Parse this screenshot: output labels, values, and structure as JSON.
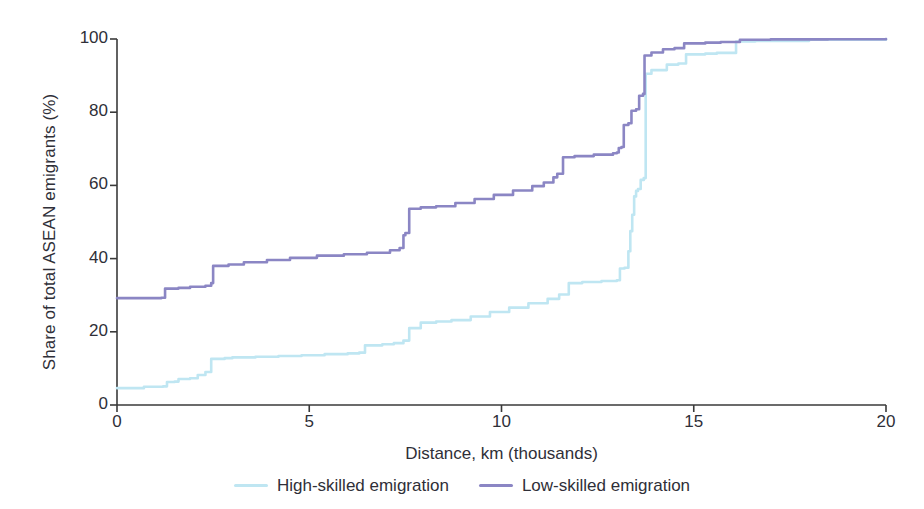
{
  "chart_data": {
    "type": "line",
    "title": "",
    "subtitle": "",
    "xlabel": "Distance, km (thousands)",
    "ylabel": "Share of total ASEAN emigrants (%)",
    "xlim": [
      0,
      20
    ],
    "ylim": [
      0,
      100
    ],
    "xticks": [
      0,
      5,
      10,
      15,
      20
    ],
    "yticks": [
      0,
      20,
      40,
      60,
      80,
      100
    ],
    "xtick_labels": [
      "0",
      "5",
      "10",
      "15",
      "20"
    ],
    "ytick_labels": [
      "0",
      "20",
      "40",
      "60",
      "80",
      "100"
    ],
    "grid": false,
    "legend_position": "bottom-center",
    "colors": {
      "high_skilled": "#bfe6f2",
      "low_skilled": "#8b86c4",
      "axis": "#3a3a3a",
      "text": "#2f2f38",
      "background": "#ffffff"
    },
    "series": [
      {
        "name": "High-skilled emigration",
        "color": "#bfe6f2",
        "step": true,
        "points": [
          [
            0.0,
            4.6
          ],
          [
            0.6,
            4.6
          ],
          [
            0.7,
            5.0
          ],
          [
            1.2,
            5.1
          ],
          [
            1.3,
            6.3
          ],
          [
            1.5,
            6.4
          ],
          [
            1.6,
            7.1
          ],
          [
            1.9,
            7.3
          ],
          [
            2.1,
            8.2
          ],
          [
            2.3,
            9.0
          ],
          [
            2.45,
            12.6
          ],
          [
            2.8,
            12.8
          ],
          [
            3.0,
            13.0
          ],
          [
            3.6,
            13.2
          ],
          [
            4.2,
            13.4
          ],
          [
            4.8,
            13.6
          ],
          [
            5.4,
            13.9
          ],
          [
            6.0,
            14.1
          ],
          [
            6.3,
            14.3
          ],
          [
            6.45,
            16.3
          ],
          [
            6.9,
            16.6
          ],
          [
            7.2,
            16.9
          ],
          [
            7.45,
            17.6
          ],
          [
            7.6,
            21.0
          ],
          [
            7.9,
            22.5
          ],
          [
            8.3,
            22.8
          ],
          [
            8.7,
            23.2
          ],
          [
            9.2,
            24.2
          ],
          [
            9.7,
            25.4
          ],
          [
            10.2,
            26.6
          ],
          [
            10.7,
            27.8
          ],
          [
            11.2,
            29.0
          ],
          [
            11.5,
            30.2
          ],
          [
            11.75,
            33.3
          ],
          [
            12.1,
            33.6
          ],
          [
            12.6,
            33.9
          ],
          [
            13.0,
            34.1
          ],
          [
            13.08,
            37.3
          ],
          [
            13.2,
            37.5
          ],
          [
            13.3,
            42.0
          ],
          [
            13.35,
            47.5
          ],
          [
            13.4,
            52.0
          ],
          [
            13.45,
            57.0
          ],
          [
            13.5,
            58.5
          ],
          [
            13.55,
            59.0
          ],
          [
            13.62,
            61.5
          ],
          [
            13.7,
            62.0
          ],
          [
            13.75,
            90.5
          ],
          [
            13.9,
            91.5
          ],
          [
            14.3,
            93.0
          ],
          [
            14.6,
            93.3
          ],
          [
            14.8,
            95.8
          ],
          [
            15.3,
            96.0
          ],
          [
            15.6,
            96.2
          ],
          [
            16.1,
            99.3
          ],
          [
            16.6,
            99.5
          ],
          [
            18.0,
            99.8
          ],
          [
            20.0,
            100.0
          ]
        ]
      },
      {
        "name": "Low-skilled emigration",
        "color": "#8b86c4",
        "step": true,
        "points": [
          [
            0.0,
            29.2
          ],
          [
            0.6,
            29.2
          ],
          [
            1.15,
            29.3
          ],
          [
            1.25,
            31.8
          ],
          [
            1.6,
            32.0
          ],
          [
            1.9,
            32.3
          ],
          [
            2.3,
            32.6
          ],
          [
            2.45,
            33.3
          ],
          [
            2.5,
            38.0
          ],
          [
            2.9,
            38.4
          ],
          [
            3.3,
            39.0
          ],
          [
            3.9,
            39.6
          ],
          [
            4.5,
            40.2
          ],
          [
            5.2,
            40.8
          ],
          [
            5.9,
            41.2
          ],
          [
            6.5,
            41.6
          ],
          [
            7.1,
            42.3
          ],
          [
            7.35,
            42.9
          ],
          [
            7.45,
            46.4
          ],
          [
            7.5,
            47.0
          ],
          [
            7.6,
            53.6
          ],
          [
            7.9,
            54.0
          ],
          [
            8.3,
            54.3
          ],
          [
            8.8,
            55.2
          ],
          [
            9.3,
            56.3
          ],
          [
            9.8,
            57.4
          ],
          [
            10.3,
            58.6
          ],
          [
            10.8,
            59.8
          ],
          [
            11.1,
            60.8
          ],
          [
            11.35,
            62.2
          ],
          [
            11.45,
            63.2
          ],
          [
            11.6,
            67.7
          ],
          [
            11.9,
            68.0
          ],
          [
            12.4,
            68.4
          ],
          [
            12.9,
            68.8
          ],
          [
            13.0,
            69.0
          ],
          [
            13.05,
            70.2
          ],
          [
            13.12,
            70.5
          ],
          [
            13.18,
            76.5
          ],
          [
            13.3,
            77.0
          ],
          [
            13.38,
            80.4
          ],
          [
            13.5,
            80.8
          ],
          [
            13.58,
            84.5
          ],
          [
            13.68,
            85.0
          ],
          [
            13.72,
            95.5
          ],
          [
            13.9,
            96.3
          ],
          [
            14.2,
            97.2
          ],
          [
            14.5,
            97.5
          ],
          [
            14.75,
            98.8
          ],
          [
            15.3,
            99.0
          ],
          [
            15.7,
            99.2
          ],
          [
            16.2,
            99.8
          ],
          [
            17.0,
            99.9
          ],
          [
            18.5,
            99.95
          ],
          [
            20.0,
            100.0
          ]
        ]
      }
    ]
  },
  "axis": {
    "y_title": "Share of total ASEAN emigrants (%)",
    "x_title": "Distance, km (thousands)"
  },
  "legend": {
    "items": [
      {
        "label": "High-skilled emigration",
        "color": "#bfe6f2"
      },
      {
        "label": "Low-skilled emigration",
        "color": "#8b86c4"
      }
    ]
  }
}
